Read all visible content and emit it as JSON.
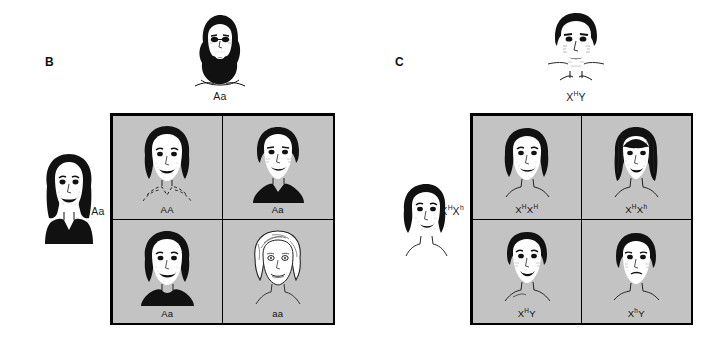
{
  "figure": {
    "title_hidden": "",
    "background_color": "#ffffff",
    "grid_fill_color": "#c3c3c3",
    "line_color": "#000000"
  },
  "panels": [
    {
      "letter": "B",
      "trait": "autosomal-recessive-albinism",
      "top_parent": {
        "label_text": "Aa",
        "label_base": "Aa",
        "icon": "bearded-man-face-icon",
        "sex": "male"
      },
      "left_parent": {
        "label_text": "Aa",
        "label_base": "Aa",
        "icon": "woman-face-icon",
        "sex": "female"
      },
      "cells": [
        {
          "label": "AA",
          "sup1": "",
          "sup2": "",
          "icon": "girl-face-icon",
          "phenotype": "unaffected"
        },
        {
          "label": "Aa",
          "sup1": "",
          "sup2": "",
          "icon": "boy-face-icon",
          "phenotype": "unaffected-carrier"
        },
        {
          "label": "Aa",
          "sup1": "",
          "sup2": "",
          "icon": "girl-face-icon",
          "phenotype": "unaffected-carrier"
        },
        {
          "label": "aa",
          "sup1": "",
          "sup2": "",
          "icon": "albino-child-face-icon",
          "phenotype": "affected-albino"
        }
      ]
    },
    {
      "letter": "C",
      "trait": "x-linked-recessive-hemophilia",
      "top_parent": {
        "label_pre": "X",
        "label_sup1": "H",
        "label_mid": "Y",
        "label_text": "XHY",
        "icon": "man-face-icon",
        "sex": "male"
      },
      "left_parent": {
        "label_pre": "X",
        "label_sup1": "H",
        "label_mid": "X",
        "label_sup2": "h",
        "label_text": "XHXh",
        "icon": "woman-face-side-icon",
        "sex": "female"
      },
      "cells": [
        {
          "pre": "X",
          "sup1": "H",
          "mid": "X",
          "sup2": "H",
          "label": "XHXH",
          "icon": "girl-face-icon",
          "phenotype": "unaffected-female"
        },
        {
          "pre": "X",
          "sup1": "H",
          "mid": "X",
          "sup2": "h",
          "label": "XHXh",
          "icon": "girl-long-hair-face-icon",
          "phenotype": "carrier-female"
        },
        {
          "pre": "X",
          "sup1": "H",
          "mid": "Y",
          "sup2": "",
          "label": "XHY",
          "icon": "boy-face-icon",
          "phenotype": "unaffected-male"
        },
        {
          "pre": "X",
          "sup1": "h",
          "mid": "Y",
          "sup2": "",
          "label": "XhY",
          "icon": "boy-face-icon",
          "phenotype": "affected-male-hemophilia"
        }
      ]
    }
  ]
}
